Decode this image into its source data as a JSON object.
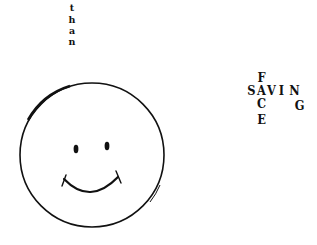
{
  "vertical_word": {
    "text": "than",
    "letters": [
      "t",
      "h",
      "a",
      "n"
    ]
  },
  "crossword": {
    "across": "SAVING",
    "down": "FACE",
    "cells": [
      {
        "ch": "F",
        "col": 1,
        "row": 0
      },
      {
        "ch": "S",
        "col": 0,
        "row": 1
      },
      {
        "ch": "A",
        "col": 1,
        "row": 1
      },
      {
        "ch": "V",
        "col": 2,
        "row": 1
      },
      {
        "ch": "I",
        "col": 3,
        "row": 1
      },
      {
        "ch": "N",
        "col": 4,
        "row": 1
      },
      {
        "ch": "C",
        "col": 1,
        "row": 2
      },
      {
        "ch": "G",
        "col": 4,
        "row": 2
      },
      {
        "ch": "E",
        "col": 1,
        "row": 3
      }
    ]
  },
  "smiley": {
    "description": "hand-drawn smiley face",
    "stroke_color": "#111111"
  }
}
